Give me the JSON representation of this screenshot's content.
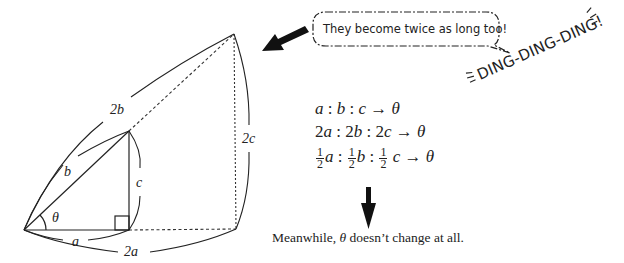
{
  "diagram": {
    "labels": {
      "inner_base": "a",
      "inner_hyp": "b",
      "inner_height": "c",
      "outer_base": "2a",
      "outer_hyp": "2b",
      "outer_height": "2c",
      "angle": "θ"
    },
    "speech_bubble": "They become twice as long too!",
    "sound_effect": "DING-DING-DING!",
    "ratios": [
      {
        "id": "r1",
        "parts": [
          "a",
          "b",
          "c"
        ],
        "result": "θ"
      },
      {
        "id": "r2",
        "parts": [
          "2a",
          "2b",
          "2c"
        ],
        "result": "θ"
      },
      {
        "id": "r3",
        "parts": [
          "1/2 a",
          "1/2 b",
          "1/2 c"
        ],
        "result": "θ"
      }
    ],
    "ratio_text": {
      "r1_a": "a",
      "r1_b": "b",
      "r1_c": "c",
      "r2_a": "a",
      "r2_b": "b",
      "r2_c": "c",
      "r2_coef": "2",
      "r3_a": "a",
      "r3_b": "b",
      "r3_c": "c",
      "frac_num": "1",
      "frac_den": "2",
      "sep": " : ",
      "arrow": " → ",
      "theta": "θ"
    },
    "caption": {
      "before": "Meanwhile, ",
      "theta": "θ",
      "after": " doesn’t change at all."
    },
    "colors": {
      "ink": "#222222",
      "background": "#ffffff"
    }
  }
}
